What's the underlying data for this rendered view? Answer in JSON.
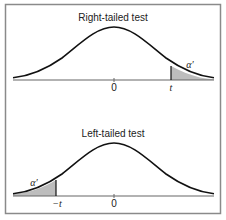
{
  "figure": {
    "frame_color": "#8a8a8a",
    "curve_color": "#111111",
    "shade_color": "#bdbdbd",
    "axis_color": "#666666",
    "panels": [
      {
        "title": "Right-tailed test",
        "tail": "right",
        "tick_labels": [
          "0",
          "t"
        ],
        "area_label": "α′"
      },
      {
        "title": "Left-tailed test",
        "tail": "left",
        "tick_labels": [
          "−t",
          "0"
        ],
        "area_label": "α′"
      }
    ]
  }
}
